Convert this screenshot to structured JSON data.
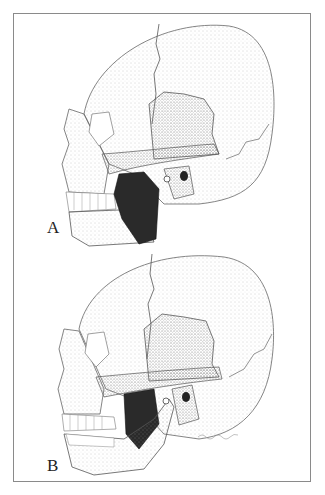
{
  "figure": {
    "panels": [
      {
        "label": "A",
        "description": "Lateral skull with masseter muscle (dark) shown on mandible, jaw closed"
      },
      {
        "label": "B",
        "description": "Lateral skull with mandible opened and rotated, showing muscle beneath zygomatic arch"
      }
    ],
    "colors": {
      "ink": "#222222",
      "muscle": "#2a2a2a",
      "frame": "#8a8a8a",
      "background": "#ffffff"
    }
  }
}
